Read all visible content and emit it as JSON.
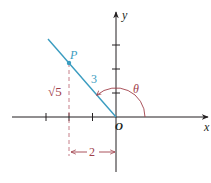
{
  "diagram": {
    "colors": {
      "axis": "#231f20",
      "line": "#3a9cc0",
      "point": "#3a9cc0",
      "angle_arc": "#a0404a",
      "dashed": "#c0707a",
      "dimension": "#a0404a",
      "labels_dark": "#231f20",
      "label_line": "#3a9cc0",
      "label_accent": "#a0404a"
    },
    "axes": {
      "x_label": "x",
      "y_label": "y",
      "origin_label": "O",
      "x_ticks": [
        -3,
        -2,
        -1
      ],
      "y_ticks": [
        1,
        2,
        3
      ]
    },
    "point": {
      "label": "P",
      "coords": [
        -2,
        2.236
      ]
    },
    "labels": {
      "hypotenuse": "3",
      "vertical_leg": "√5",
      "horizontal_leg": "2",
      "angle": "θ"
    }
  }
}
